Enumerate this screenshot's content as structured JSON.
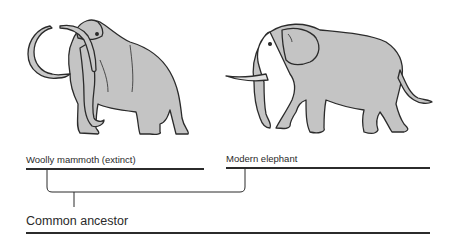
{
  "diagram": {
    "type": "evolutionary-tree",
    "organisms": [
      {
        "name": "woolly-mammoth",
        "label": "Woolly mammoth (extinct)"
      },
      {
        "name": "modern-elephant",
        "label": "Modern elephant"
      }
    ],
    "ancestor": {
      "label": "Common ancestor"
    },
    "colors": {
      "animal_fill": "#c4c4c4",
      "outline": "#2b2b2b",
      "line": "#2b2b2b"
    }
  }
}
